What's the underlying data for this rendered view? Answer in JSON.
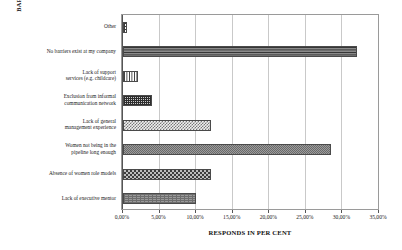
{
  "chart_data": {
    "type": "bar",
    "orientation": "horizontal",
    "title": "",
    "xlabel": "RESPONDS IN PER CENT",
    "ylabel": "BARRIERS TO WOMEN'S PROMOTION",
    "xlim": [
      0,
      35
    ],
    "xtick_labels": [
      "0,00%",
      "5,00%",
      "10,00%",
      "15,00%",
      "20,00%",
      "25,00%",
      "30,00%",
      "35,00%"
    ],
    "xtick_values": [
      0,
      5,
      10,
      15,
      20,
      25,
      30,
      35
    ],
    "grid": true,
    "legend": "none",
    "categories": [
      "Other",
      "No barriers exist at my company",
      "Lack of support\nservices (e.g. childcare)",
      "Exclusion from informal\ncommunication network",
      "Lack of general\nmanagement experience",
      "Women not being in the\npipeline long enough",
      "Absence of women role models",
      "Lack of executive mentor"
    ],
    "values": [
      0.5,
      32.0,
      2.0,
      4.0,
      12.0,
      28.5,
      12.0,
      10.0
    ],
    "bars": [
      {
        "label": "Other",
        "label_lines": [
          "Other"
        ],
        "value": 0.5,
        "pattern": "pat-grid-coarse"
      },
      {
        "label": "No barriers exist at my company",
        "label_lines": [
          "No barriers exist at my company"
        ],
        "value": 32.0,
        "pattern": "pat-hlines"
      },
      {
        "label": "Lack of support services (e.g. childcare)",
        "label_lines": [
          "Lack of support",
          "services (e.g. childcare)"
        ],
        "value": 2.0,
        "pattern": "pat-vlines"
      },
      {
        "label": "Exclusion from informal communication network",
        "label_lines": [
          "Exclusion from informal",
          "communication network"
        ],
        "value": 4.0,
        "pattern": "pat-grid-fine"
      },
      {
        "label": "Lack of general management experience",
        "label_lines": [
          "Lack of general",
          "management experience"
        ],
        "value": 12.0,
        "pattern": "pat-checker-light"
      },
      {
        "label": "Women not being in the pipeline long enough",
        "label_lines": [
          "Women not being in the",
          "pipeline long enough"
        ],
        "value": 28.5,
        "pattern": "pat-noise-mid"
      },
      {
        "label": "Absence of women role models",
        "label_lines": [
          "Absence of women role models"
        ],
        "value": 12.0,
        "pattern": "pat-checker-dark"
      },
      {
        "label": "Lack of executive mentor",
        "label_lines": [
          "Lack of executive mentor"
        ],
        "value": 10.0,
        "pattern": "pat-speckle"
      }
    ]
  }
}
